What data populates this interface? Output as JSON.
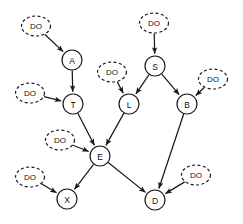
{
  "diagram": {
    "type": "directed-graph",
    "width": 243,
    "height": 224,
    "background_color": "#ffffff",
    "stroke_color": "#1a1a1a",
    "node_fill": "#ffffff",
    "node_radius": 10,
    "do_ellipse_rx": 14.5,
    "do_ellipse_ry": 10,
    "do_label": "DO",
    "nodes": [
      {
        "id": "A",
        "label": "A",
        "x": 72,
        "y": 60,
        "shape": "circle",
        "style": "solid"
      },
      {
        "id": "T",
        "label": "T",
        "x": 73,
        "y": 104,
        "shape": "circle",
        "style": "solid"
      },
      {
        "id": "S",
        "label": "S",
        "x": 155,
        "y": 66,
        "shape": "circle",
        "style": "solid"
      },
      {
        "id": "L",
        "label": "L",
        "x": 129,
        "y": 104,
        "shape": "circle",
        "style": "solid"
      },
      {
        "id": "B",
        "label": "B",
        "x": 187,
        "y": 104,
        "shape": "circle",
        "style": "solid"
      },
      {
        "id": "E",
        "label": "E",
        "x": 100,
        "y": 156,
        "shape": "circle",
        "style": "solid"
      },
      {
        "id": "X",
        "label": "X",
        "x": 67,
        "y": 199,
        "shape": "circle",
        "style": "solid"
      },
      {
        "id": "D",
        "label": "D",
        "x": 155,
        "y": 200,
        "shape": "circle",
        "style": "solid"
      }
    ],
    "do_nodes": [
      {
        "id": "DO_A",
        "label": "DO",
        "x": 36,
        "y": 26,
        "shape": "ellipse",
        "style": "dashed",
        "target": "A"
      },
      {
        "id": "DO_T",
        "label": "DO",
        "x": 30,
        "y": 93,
        "shape": "ellipse",
        "style": "dashed",
        "target": "T"
      },
      {
        "id": "DO_S",
        "label": "DO",
        "x": 154,
        "y": 23,
        "shape": "ellipse",
        "style": "dashed",
        "target": "S"
      },
      {
        "id": "DO_L",
        "label": "DO",
        "x": 112,
        "y": 72,
        "shape": "ellipse",
        "style": "dashed",
        "target": "L"
      },
      {
        "id": "DO_B",
        "label": "DO",
        "x": 213,
        "y": 79,
        "shape": "ellipse",
        "style": "dashed",
        "target": "B"
      },
      {
        "id": "DO_E",
        "label": "DO",
        "x": 60,
        "y": 140,
        "shape": "ellipse",
        "style": "dashed",
        "target": "E"
      },
      {
        "id": "DO_X",
        "label": "DO",
        "x": 30,
        "y": 177,
        "shape": "ellipse",
        "style": "dashed",
        "target": "X"
      },
      {
        "id": "DO_D",
        "label": "DO",
        "x": 196,
        "y": 175,
        "shape": "ellipse",
        "style": "dashed",
        "target": "D"
      }
    ],
    "edges": [
      {
        "from": "DO_A",
        "to": "A",
        "arrow": true,
        "style": "solid"
      },
      {
        "from": "A",
        "to": "T",
        "arrow": true,
        "style": "solid"
      },
      {
        "from": "DO_T",
        "to": "T",
        "arrow": true,
        "style": "solid"
      },
      {
        "from": "DO_S",
        "to": "S",
        "arrow": true,
        "style": "solid"
      },
      {
        "from": "S",
        "to": "L",
        "arrow": true,
        "style": "solid"
      },
      {
        "from": "S",
        "to": "B",
        "arrow": true,
        "style": "solid"
      },
      {
        "from": "DO_L",
        "to": "L",
        "arrow": true,
        "style": "solid"
      },
      {
        "from": "DO_B",
        "to": "B",
        "arrow": true,
        "style": "solid"
      },
      {
        "from": "T",
        "to": "E",
        "arrow": true,
        "style": "solid"
      },
      {
        "from": "L",
        "to": "E",
        "arrow": true,
        "style": "solid"
      },
      {
        "from": "DO_E",
        "to": "E",
        "arrow": true,
        "style": "solid"
      },
      {
        "from": "E",
        "to": "X",
        "arrow": true,
        "style": "solid"
      },
      {
        "from": "DO_X",
        "to": "X",
        "arrow": true,
        "style": "solid"
      },
      {
        "from": "E",
        "to": "D",
        "arrow": true,
        "style": "solid"
      },
      {
        "from": "B",
        "to": "D",
        "arrow": true,
        "style": "solid"
      },
      {
        "from": "DO_D",
        "to": "D",
        "arrow": true,
        "style": "solid"
      }
    ]
  }
}
